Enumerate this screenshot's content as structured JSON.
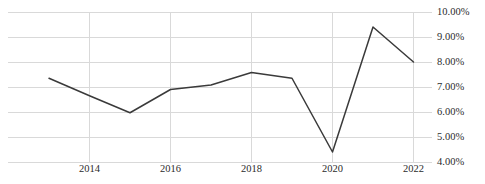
{
  "chart_data": {
    "type": "line",
    "title": "",
    "subtitle": "",
    "xlabel": "",
    "ylabel": "",
    "x": [
      2013,
      2014,
      2015,
      2016,
      2017,
      2018,
      2019,
      2020,
      2021,
      2022
    ],
    "series": [
      {
        "name": "",
        "values": [
          7.35,
          6.65,
          5.97,
          6.9,
          7.08,
          7.58,
          7.35,
          4.4,
          9.4,
          8.0
        ]
      }
    ],
    "categories": [
      "2013",
      "2014",
      "2015",
      "2016",
      "2017",
      "2018",
      "2019",
      "2020",
      "2021",
      "2022"
    ],
    "xlim": [
      2013,
      2022
    ],
    "ylim": [
      4.0,
      10.0
    ],
    "y_tick_values": [
      10.0,
      9.0,
      8.0,
      7.0,
      6.0,
      5.0,
      4.0
    ],
    "y_tick_labels": [
      "10.00%",
      "9.00%",
      "8.00%",
      "7.00%",
      "6.00%",
      "5.00%",
      "4.00%"
    ],
    "x_tick_values": [
      2014,
      2016,
      2018,
      2020,
      2022
    ],
    "x_tick_labels": [
      "2014",
      "2016",
      "2018",
      "2020",
      "2022"
    ],
    "grid": {
      "horizontal": true,
      "vertical": true,
      "color": "#d9d9d9"
    },
    "legend": {
      "visible": false,
      "position": "none",
      "entries": []
    },
    "value_format": "percent",
    "line_color": "#3a3a3a",
    "line_width": 1.5,
    "markers": false,
    "background_color": "#ffffff"
  }
}
